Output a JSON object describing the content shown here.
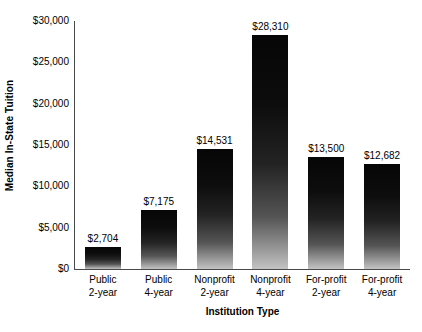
{
  "chart_data": {
    "type": "bar",
    "title": "",
    "xlabel": "Institution Type",
    "ylabel": "Median In-State Tuition",
    "ylim": [
      0,
      30000
    ],
    "ytick_values": [
      0,
      5000,
      10000,
      15000,
      20000,
      25000,
      30000
    ],
    "ytick_labels": [
      "$0",
      "$5,000",
      "$10,000",
      "$15,000",
      "$20,000",
      "$25,000",
      "$30,000"
    ],
    "grid": false,
    "legend": "none",
    "categories": [
      "Public 2-year",
      "Public 4-year",
      "Nonprofit 2-year",
      "Nonprofit 4-year",
      "For-profit 2-year",
      "For-profit 4-year"
    ],
    "category_lines": [
      {
        "line1": "Public",
        "line2": "2-year"
      },
      {
        "line1": "Public",
        "line2": "4-year"
      },
      {
        "line1": "Nonprofit",
        "line2": "2-year"
      },
      {
        "line1": "Nonprofit",
        "line2": "4-year"
      },
      {
        "line1": "For-profit",
        "line2": "2-year"
      },
      {
        "line1": "For-profit",
        "line2": "4-year"
      }
    ],
    "values": [
      2704,
      7175,
      14531,
      28310,
      13500,
      12682
    ],
    "value_labels": [
      "$2,704",
      "$7,175",
      "$14,531",
      "$28,310",
      "$13,500",
      "$12,682"
    ],
    "bar_gradient_top": "#060606",
    "bar_gradient_bottom": "#c3c3c3",
    "axis_color": "#4a4a4a",
    "background_color": "#ffffff",
    "text_color": "#000000"
  }
}
